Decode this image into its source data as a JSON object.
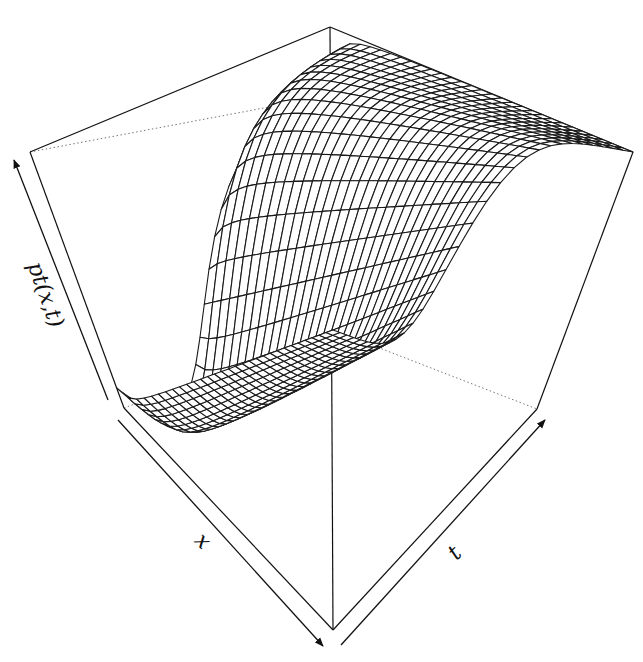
{
  "chart_data": {
    "type": "surface",
    "subtype": "perspective-wireframe",
    "title": "",
    "function": "pt(x,t)",
    "xlabel": "x",
    "ylabel": "t",
    "zlabel": "pt(x,t)",
    "xlim": [
      -4,
      4
    ],
    "tlim": [
      1,
      30
    ],
    "zlim": [
      0,
      1
    ],
    "grid_lines_x": 31,
    "grid_lines_t": 31,
    "ticks": "none",
    "box": true,
    "line_color": "#1a1a1a",
    "hidden_edge_style": "dotted"
  },
  "labels": {
    "z_axis": "pt(x,t)",
    "x_axis": "x",
    "t_axis": "t"
  }
}
